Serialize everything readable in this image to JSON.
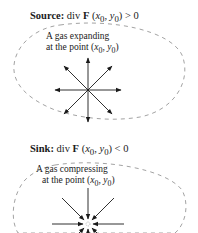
{
  "source": {
    "label": "Source:",
    "expression": "div F (x0, y0) > 0",
    "expr_prefix": "div ",
    "expr_F": "F",
    "expr_args": "(x",
    "expr_sub0": "0",
    "expr_mid": ", y",
    "expr_sub1": "0",
    "expr_rel": ") > 0",
    "caption_line1": "A gas expanding",
    "caption_line2_prefix": "at the point (x",
    "caption_sub0": "0",
    "caption_mid": ", y",
    "caption_sub1": "0",
    "caption_end": ")",
    "arrow_direction": "outward",
    "arrow_count": 8
  },
  "sink": {
    "label": "Sink:",
    "expression": "div F (x0, y0) < 0",
    "expr_prefix": "div ",
    "expr_F": "F",
    "expr_args": "(x",
    "expr_sub0": "0",
    "expr_mid": ", y",
    "expr_sub1": "0",
    "expr_rel": ") < 0",
    "caption_line1": "A gas compressing",
    "caption_line2_prefix": "at the point (x",
    "caption_sub0": "0",
    "caption_mid": ", y",
    "caption_sub1": "0",
    "caption_end": ")",
    "arrow_direction": "inward",
    "arrow_count": 8
  },
  "colors": {
    "ink": "#1a1a1a",
    "dashed_boundary": "#8a8a8a",
    "background": "#ffffff"
  }
}
